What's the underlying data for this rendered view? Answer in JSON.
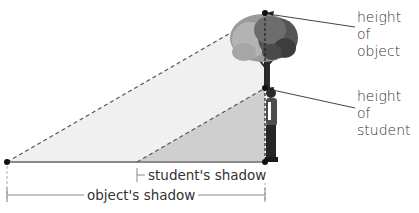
{
  "labels": {
    "height_of_object_line1": "height of",
    "height_of_object_line2": "object",
    "height_of_student_line1": "height of",
    "height_of_student_line2": "student",
    "students_shadow": "student's shadow",
    "objects_shadow": "object's shadow"
  },
  "geometry": {
    "shadow_tip": [
      7,
      162
    ],
    "base_point": [
      265,
      162
    ],
    "object_top": [
      265,
      13
    ],
    "student_top": [
      265,
      88
    ],
    "student_shadow_start": [
      137,
      162
    ]
  },
  "colors": {
    "large_triangle_fill": "#f0f0f0",
    "small_triangle_fill": "#cfcfcf",
    "line": "#555555",
    "ground_line": "#8a8a8a",
    "dot": "#111111",
    "text": "#333333"
  }
}
